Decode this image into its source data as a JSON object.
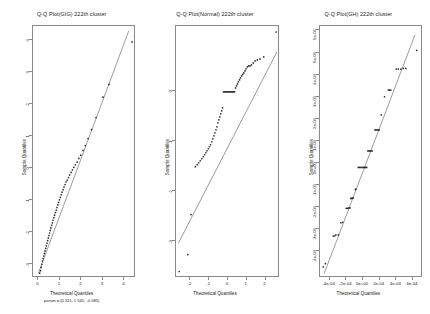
{
  "figure": {
    "layout": "1x3 panel grid",
    "background": "#ffffff"
  },
  "chart_data": [
    {
      "type": "scatter",
      "title": "Q-Q Plot(GIG) 222th cluster",
      "xlabel": "Theoretical Quantiles",
      "sublabel": "param = (0.311, 1.545, -0.085)",
      "ylabel": "Sample Quantiles",
      "xlim": [
        -0.25,
        4.55
      ],
      "ylim": [
        -3.45,
        4.45
      ],
      "xticks": [
        0,
        1,
        2,
        3,
        4
      ],
      "yticks": [
        -3,
        -2,
        -1,
        0,
        1,
        2,
        3,
        4
      ],
      "ytick_labels": [
        "-3",
        "-2",
        "-1",
        "0",
        "1",
        "2",
        "3",
        "4"
      ],
      "grid": false,
      "legend": "none",
      "refline": {
        "x": [
          0.0,
          4.2
        ],
        "y": [
          -3.3,
          4.3
        ]
      },
      "points": [
        [
          0.06,
          -3.3
        ],
        [
          0.1,
          -3.22
        ],
        [
          0.13,
          -3.12
        ],
        [
          0.16,
          -3.02
        ],
        [
          0.19,
          -2.92
        ],
        [
          0.22,
          -2.84
        ],
        [
          0.25,
          -2.76
        ],
        [
          0.28,
          -2.68
        ],
        [
          0.31,
          -2.6
        ],
        [
          0.34,
          -2.52
        ],
        [
          0.37,
          -2.44
        ],
        [
          0.4,
          -2.36
        ],
        [
          0.43,
          -2.28
        ],
        [
          0.46,
          -2.2
        ],
        [
          0.49,
          -2.12
        ],
        [
          0.52,
          -2.04
        ],
        [
          0.55,
          -1.96
        ],
        [
          0.58,
          -1.88
        ],
        [
          0.62,
          -1.8
        ],
        [
          0.65,
          -1.72
        ],
        [
          0.68,
          -1.64
        ],
        [
          0.72,
          -1.56
        ],
        [
          0.75,
          -1.48
        ],
        [
          0.79,
          -1.4
        ],
        [
          0.83,
          -1.32
        ],
        [
          0.86,
          -1.24
        ],
        [
          0.9,
          -1.16
        ],
        [
          0.94,
          -1.08
        ],
        [
          0.98,
          -1.0
        ],
        [
          1.02,
          -0.92
        ],
        [
          1.06,
          -0.84
        ],
        [
          1.1,
          -0.76
        ],
        [
          1.15,
          -0.68
        ],
        [
          1.19,
          -0.6
        ],
        [
          1.24,
          -0.52
        ],
        [
          1.29,
          -0.44
        ],
        [
          1.34,
          -0.38
        ],
        [
          1.4,
          -0.3
        ],
        [
          1.45,
          -0.22
        ],
        [
          1.52,
          -0.14
        ],
        [
          1.58,
          -0.06
        ],
        [
          1.65,
          0.02
        ],
        [
          1.72,
          0.1
        ],
        [
          1.8,
          0.18
        ],
        [
          1.88,
          0.3
        ],
        [
          1.97,
          0.4
        ],
        [
          2.07,
          0.55
        ],
        [
          2.18,
          0.7
        ],
        [
          2.31,
          0.92
        ],
        [
          2.47,
          1.2
        ],
        [
          2.68,
          1.58
        ],
        [
          3.0,
          2.22
        ],
        [
          3.28,
          2.62
        ],
        [
          4.35,
          3.95
        ]
      ]
    },
    {
      "type": "scatter",
      "title": "Q-Q Plot(Normal) 222th cluster",
      "xlabel": "Theoretical Quantiles",
      "ylabel": "Sample Quantiles",
      "xlim": [
        -2.75,
        2.75
      ],
      "ylim": [
        -3.75,
        1.3
      ],
      "xticks": [
        -2,
        -1,
        0,
        1,
        2
      ],
      "yticks": [
        -3,
        -2,
        -1,
        0
      ],
      "ytick_labels": [
        "-3",
        "-2",
        "-1",
        "0"
      ],
      "grid": false,
      "legend": "none",
      "refline": {
        "x": [
          -2.62,
          2.62
        ],
        "y": [
          -3.05,
          0.78
        ]
      },
      "points": [
        [
          -2.58,
          -3.62
        ],
        [
          -2.12,
          -3.28
        ],
        [
          -1.95,
          -2.48
        ],
        [
          -1.72,
          -1.52
        ],
        [
          -1.62,
          -1.48
        ],
        [
          -1.54,
          -1.44
        ],
        [
          -1.46,
          -1.4
        ],
        [
          -1.38,
          -1.36
        ],
        [
          -1.3,
          -1.32
        ],
        [
          -1.23,
          -1.28
        ],
        [
          -1.16,
          -1.24
        ],
        [
          -1.1,
          -1.2
        ],
        [
          -1.03,
          -1.16
        ],
        [
          -0.97,
          -1.12
        ],
        [
          -0.91,
          -1.08
        ],
        [
          -0.85,
          -1.02
        ],
        [
          -0.79,
          -0.96
        ],
        [
          -0.73,
          -0.9
        ],
        [
          -0.68,
          -0.84
        ],
        [
          -0.62,
          -0.78
        ],
        [
          -0.57,
          -0.72
        ],
        [
          -0.52,
          -0.64
        ],
        [
          -0.47,
          -0.58
        ],
        [
          -0.42,
          -0.52
        ],
        [
          -0.37,
          -0.46
        ],
        [
          -0.32,
          -0.4
        ],
        [
          -0.27,
          -0.34
        ],
        [
          -0.22,
          -0.02
        ],
        [
          -0.16,
          -0.02
        ],
        [
          -0.11,
          -0.02
        ],
        [
          -0.06,
          -0.02
        ],
        [
          0.0,
          -0.02
        ],
        [
          0.05,
          -0.02
        ],
        [
          0.1,
          -0.02
        ],
        [
          0.16,
          -0.02
        ],
        [
          0.21,
          -0.02
        ],
        [
          0.26,
          -0.02
        ],
        [
          0.31,
          -0.02
        ],
        [
          0.37,
          -0.02
        ],
        [
          0.42,
          0.06
        ],
        [
          0.47,
          0.1
        ],
        [
          0.52,
          0.14
        ],
        [
          0.57,
          0.18
        ],
        [
          0.63,
          0.22
        ],
        [
          0.68,
          0.26
        ],
        [
          0.74,
          0.3
        ],
        [
          0.8,
          0.33
        ],
        [
          0.86,
          0.36
        ],
        [
          0.92,
          0.4
        ],
        [
          0.98,
          0.44
        ],
        [
          1.05,
          0.48
        ],
        [
          1.12,
          0.5
        ],
        [
          1.19,
          0.5
        ],
        [
          1.27,
          0.52
        ],
        [
          1.36,
          0.56
        ],
        [
          1.46,
          0.6
        ],
        [
          1.58,
          0.62
        ],
        [
          1.72,
          0.64
        ],
        [
          1.92,
          0.68
        ],
        [
          2.58,
          1.18
        ]
      ]
    },
    {
      "type": "scatter",
      "title": "Q-Q Plot(GH) 222th cluster",
      "xlabel": "Theoretical Quantiles",
      "ylabel": "Sample Quantiles",
      "xlim": [
        -0.00052,
        0.00072
      ],
      "ylim": [
        -0.00052,
        0.00062
      ],
      "xticks": [
        -0.0004,
        -0.0002,
        0,
        0.0002,
        0.0004,
        0.0006
      ],
      "xtick_labels": [
        "-4e-04",
        "-2e-04",
        "0e+00",
        "2e-04",
        "4e-04",
        "6e-04"
      ],
      "yticks": [
        -0.0004,
        -0.0003,
        -0.0002,
        -0.0001,
        0,
        0.0001,
        0.0002,
        0.0003,
        0.0004,
        0.0005,
        0.0006
      ],
      "ytick_labels": [
        "-4e-04",
        "-3e-04",
        "-2e-04",
        "-1e-04",
        "0e+00",
        "1e-04",
        "2e-04",
        "3e-04",
        "4e-04",
        "5e-04",
        "6e-04"
      ],
      "grid": false,
      "legend": "none",
      "refline": {
        "x": [
          -0.00047,
          0.00062
        ],
        "y": [
          -0.0005,
          0.00058
        ]
      },
      "points": [
        [
          -0.00048,
          -0.00047
        ],
        [
          -0.000455,
          -0.000455
        ],
        [
          -0.00036,
          -0.00033
        ],
        [
          -0.000345,
          -0.00033
        ],
        [
          -0.00033,
          -0.000325
        ],
        [
          -0.0003,
          -0.000325
        ],
        [
          -0.00027,
          -0.00027
        ],
        [
          -0.00025,
          -0.000268
        ],
        [
          -0.000205,
          -0.000205
        ],
        [
          -0.00019,
          -0.000205
        ],
        [
          -0.000175,
          -0.000203
        ],
        [
          -0.00016,
          -0.000203
        ],
        [
          -0.00015,
          -0.00016
        ],
        [
          -0.00014,
          -0.00016
        ],
        [
          -0.00013,
          -0.000158
        ],
        [
          -0.00012,
          -0.000158
        ],
        [
          -9.5e-05,
          -0.00012
        ],
        [
          -9e-05,
          -0.000118
        ],
        [
          -6e-05,
          -2e-05
        ],
        [
          -4.5e-05,
          -2e-05
        ],
        [
          -3e-05,
          -2e-05
        ],
        [
          -1.5e-05,
          -2e-05
        ],
        [
          0.0,
          -2e-05
        ],
        [
          1.2e-05,
          -2e-05
        ],
        [
          2.5e-05,
          -2e-05
        ],
        [
          4e-05,
          -2e-05
        ],
        [
          5.5e-05,
          5.5e-05
        ],
        [
          6.8e-05,
          5.5e-05
        ],
        [
          8e-05,
          5.5e-05
        ],
        [
          9.2e-05,
          5.5e-05
        ],
        [
          0.000105,
          5.5e-05
        ],
        [
          0.00014,
          0.00015
        ],
        [
          0.000152,
          0.00015
        ],
        [
          0.000165,
          0.00015
        ],
        [
          0.000178,
          0.00015
        ],
        [
          0.00019,
          0.00015
        ],
        [
          0.000215,
          0.000218
        ],
        [
          0.000255,
          0.0003
        ],
        [
          0.0003,
          0.00033
        ],
        [
          0.000315,
          0.00033
        ],
        [
          0.00033,
          0.00033
        ],
        [
          0.000395,
          0.000425
        ],
        [
          0.00042,
          0.000425
        ],
        [
          0.00045,
          0.000425
        ],
        [
          0.00048,
          0.000428
        ],
        [
          0.00051,
          0.000428
        ],
        [
          0.00064,
          0.00051
        ]
      ]
    }
  ]
}
